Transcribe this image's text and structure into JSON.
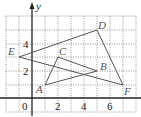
{
  "diagram": {
    "type": "coordinate-grid",
    "axis_labels": {
      "y": "y",
      "origin": "0"
    },
    "x_ticks": [
      "2",
      "4",
      "6"
    ],
    "y_ticks": [
      "2",
      "4"
    ],
    "grid": {
      "x_range": [
        -2,
        8
      ],
      "y_range": [
        -1,
        6
      ],
      "step": 1
    },
    "points": {
      "A": [
        1,
        1
      ],
      "B": [
        5,
        2
      ],
      "C": [
        2,
        3
      ],
      "D": [
        5,
        5
      ],
      "E": [
        -1,
        3
      ],
      "F": [
        7,
        1
      ]
    },
    "point_labels": {
      "A": "A",
      "B": "B",
      "C": "C",
      "D": "D",
      "E": "E",
      "F": "F"
    },
    "triangles": [
      {
        "name": "triangle-ABC",
        "vertices": [
          "A",
          "B",
          "C"
        ]
      },
      {
        "name": "triangle-DEF",
        "vertices": [
          "D",
          "E",
          "F"
        ]
      }
    ],
    "colors": {
      "grid": "#7a7a7a",
      "axis": "#222222",
      "segments": "#555555"
    }
  }
}
